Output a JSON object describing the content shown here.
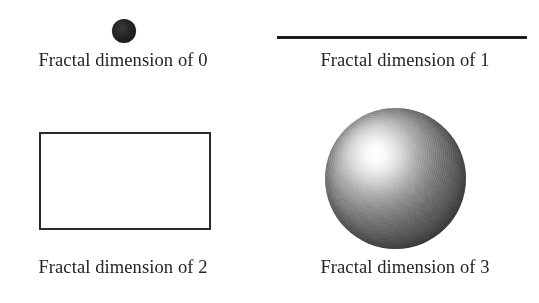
{
  "figure": {
    "background_color": "#ffffff",
    "ink_color": "#242424",
    "width": 539,
    "height": 303
  },
  "panels": [
    {
      "id": "zero",
      "shape": "point-icon",
      "caption": "Fractal dimension of 0",
      "dimension_value": "0",
      "shape_color": "#1a1a1a"
    },
    {
      "id": "one",
      "shape": "line-segment-icon",
      "caption": "Fractal dimension of 1",
      "dimension_value": "1",
      "shape_color": "#111111"
    },
    {
      "id": "two",
      "shape": "rectangle-icon",
      "caption": "Fractal dimension of 2",
      "dimension_value": "2",
      "shape_color": "#2a2a2a"
    },
    {
      "id": "three",
      "shape": "sphere-icon",
      "caption": "Fractal dimension of 3",
      "dimension_value": "3",
      "shape_color": "#5f5f5f"
    }
  ]
}
